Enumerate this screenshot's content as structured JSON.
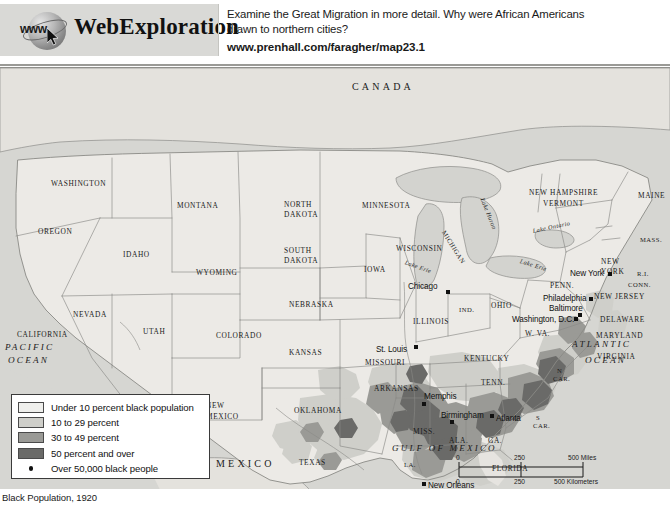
{
  "header": {
    "logo": {
      "globe_text": "www",
      "brand_web": "Web",
      "brand_exploration": "Exploration"
    },
    "prompt_line1": "Examine the Great Migration in more detail. Why were African Americans",
    "prompt_line2": "drawn to northern cities?",
    "url": "www.prenhall.com/faragher/map23.1"
  },
  "map": {
    "countries": [
      {
        "name": "CANADA",
        "x": 352,
        "y": 14
      },
      {
        "name": "MEXICO",
        "x": 216,
        "y": 391
      }
    ],
    "oceans": [
      {
        "name": "PACIFIC",
        "x": 5,
        "y": 275
      },
      {
        "name": "OCEAN",
        "x": 8,
        "y": 288
      },
      {
        "name": "ATLANTIC",
        "x": 572,
        "y": 272
      },
      {
        "name": "OCEAN",
        "x": 585,
        "y": 288
      }
    ],
    "gulf_label": {
      "name": "GULF OF MEXICO",
      "x": 392,
      "y": 376
    },
    "lakes": [
      {
        "name": "Lake Huron",
        "x": 482,
        "y": 127,
        "rot": 68
      },
      {
        "name": "Lake Erie",
        "x": 520,
        "y": 190,
        "rot": 17
      },
      {
        "name": "Lake Ontario",
        "x": 533,
        "y": 160,
        "rot": -12
      },
      {
        "name": "Lake Erie",
        "x": 405,
        "y": 191,
        "rot": 20
      }
    ],
    "states": [
      {
        "name": "WASHINGTON",
        "x": 51,
        "y": 112,
        "size": "state-sm"
      },
      {
        "name": "OREGON",
        "x": 38,
        "y": 160,
        "size": "state-sm"
      },
      {
        "name": "IDAHO",
        "x": 123,
        "y": 183,
        "size": "state-sm"
      },
      {
        "name": "MONTANA",
        "x": 177,
        "y": 134,
        "size": "state-sm"
      },
      {
        "name": "NORTH",
        "x": 284,
        "y": 133,
        "size": "state-sm"
      },
      {
        "name": "DAKOTA",
        "x": 284,
        "y": 143,
        "size": "state-sm"
      },
      {
        "name": "SOUTH",
        "x": 284,
        "y": 179,
        "size": "state-sm"
      },
      {
        "name": "DAKOTA",
        "x": 284,
        "y": 189,
        "size": "state-sm"
      },
      {
        "name": "MINNESOTA",
        "x": 362,
        "y": 134,
        "size": "state-sm"
      },
      {
        "name": "WYOMING",
        "x": 196,
        "y": 201,
        "size": "state-sm"
      },
      {
        "name": "NEBRASKA",
        "x": 289,
        "y": 233,
        "size": "state-sm"
      },
      {
        "name": "IOWA",
        "x": 364,
        "y": 198,
        "size": "state-sm"
      },
      {
        "name": "WISCONSIN",
        "x": 396,
        "y": 177,
        "size": "state-sm"
      },
      {
        "name": "NEVADA",
        "x": 73,
        "y": 243,
        "size": "state-sm"
      },
      {
        "name": "CALIFORNIA",
        "x": 17,
        "y": 263,
        "size": "state-sm"
      },
      {
        "name": "UTAH",
        "x": 143,
        "y": 260,
        "size": "state-sm"
      },
      {
        "name": "COLORADO",
        "x": 216,
        "y": 264,
        "size": "state-sm"
      },
      {
        "name": "KANSAS",
        "x": 289,
        "y": 281,
        "size": "state-sm"
      },
      {
        "name": "MISSOURI",
        "x": 365,
        "y": 291,
        "size": "state-sm"
      },
      {
        "name": "ILLINOIS",
        "x": 413,
        "y": 250,
        "size": "state-sm"
      },
      {
        "name": "IND.",
        "x": 459,
        "y": 239,
        "size": "state-xs"
      },
      {
        "name": "OHIO",
        "x": 491,
        "y": 234,
        "size": "state-sm"
      },
      {
        "name": "MICHIGAN",
        "x": 443,
        "y": 160,
        "size": "state-xs"
      },
      {
        "name": "ARIZONA",
        "x": 141,
        "y": 337,
        "size": "state-sm"
      },
      {
        "name": "NEW",
        "x": 206,
        "y": 334,
        "size": "state-sm"
      },
      {
        "name": "MEXICO",
        "x": 206,
        "y": 345,
        "size": "state-sm"
      },
      {
        "name": "OKLAHOMA",
        "x": 294,
        "y": 339,
        "size": "state-sm"
      },
      {
        "name": "TEXAS",
        "x": 299,
        "y": 391,
        "size": "state-sm"
      },
      {
        "name": "ARKANSAS",
        "x": 374,
        "y": 317,
        "size": "state-sm"
      },
      {
        "name": "KENTUCKY",
        "x": 464,
        "y": 287,
        "size": "state-sm"
      },
      {
        "name": "TENN.",
        "x": 481,
        "y": 311,
        "size": "state-sm"
      },
      {
        "name": "MISS.",
        "x": 413,
        "y": 360,
        "size": "state-sm"
      },
      {
        "name": "ALA.",
        "x": 449,
        "y": 369,
        "size": "state-sm"
      },
      {
        "name": "GA.",
        "x": 488,
        "y": 369,
        "size": "state-sm"
      },
      {
        "name": "LA.",
        "x": 404,
        "y": 394,
        "size": "state-xs"
      },
      {
        "name": "FLORIDA",
        "x": 492,
        "y": 397,
        "size": "state-sm"
      },
      {
        "name": "S",
        "x": 536,
        "y": 347,
        "size": "state-xs"
      },
      {
        "name": "CAR.",
        "x": 533,
        "y": 355,
        "size": "state-xs"
      },
      {
        "name": "N",
        "x": 557,
        "y": 300,
        "size": "state-xs"
      },
      {
        "name": "CAR.",
        "x": 553,
        "y": 308,
        "size": "state-xs"
      },
      {
        "name": "VIRGINIA",
        "x": 597,
        "y": 285,
        "size": "state-sm"
      },
      {
        "name": "W. VA.",
        "x": 525,
        "y": 262,
        "size": "state-sm"
      },
      {
        "name": "MARYLAND",
        "x": 596,
        "y": 264,
        "size": "state-sm"
      },
      {
        "name": "DELAWARE",
        "x": 600,
        "y": 248,
        "size": "state-sm"
      },
      {
        "name": "NEW JERSEY",
        "x": 594,
        "y": 225,
        "size": "state-sm"
      },
      {
        "name": "PENN.",
        "x": 550,
        "y": 214,
        "size": "state-sm"
      },
      {
        "name": "NEW",
        "x": 601,
        "y": 190,
        "size": "state-sm"
      },
      {
        "name": "YORK",
        "x": 601,
        "y": 200,
        "size": "state-sm"
      },
      {
        "name": "R.I.",
        "x": 637,
        "y": 203,
        "size": "state-xs"
      },
      {
        "name": "CONN.",
        "x": 628,
        "y": 214,
        "size": "state-xs"
      },
      {
        "name": "MASS.",
        "x": 640,
        "y": 169,
        "size": "state-xs"
      },
      {
        "name": "MAINE",
        "x": 638,
        "y": 124,
        "size": "state-sm"
      },
      {
        "name": "NEW HAMPSHIRE",
        "x": 529,
        "y": 121,
        "size": "state-sm"
      },
      {
        "name": "VERMONT",
        "x": 543,
        "y": 132,
        "size": "state-sm"
      }
    ],
    "cities": [
      {
        "name": "Chicago",
        "lx": 408,
        "ly": 215,
        "dx": 446,
        "dy": 222
      },
      {
        "name": "New York",
        "lx": 570,
        "ly": 202,
        "dx": 608,
        "dy": 204
      },
      {
        "name": "Philadelphia",
        "lx": 543,
        "ly": 227,
        "dx": 589,
        "dy": 229
      },
      {
        "name": "Baltimore",
        "lx": 549,
        "ly": 237,
        "dx": 578,
        "dy": 245
      },
      {
        "name": "Washington, D.C.",
        "lx": 512,
        "ly": 248,
        "dx": 574,
        "dy": 249
      },
      {
        "name": "St. Louis",
        "lx": 376,
        "ly": 278,
        "dx": 414,
        "dy": 277
      },
      {
        "name": "Memphis",
        "lx": 424,
        "ly": 325,
        "dx": 422,
        "dy": 334
      },
      {
        "name": "Birmingham",
        "lx": 441,
        "ly": 344,
        "dx": 450,
        "dy": 352
      },
      {
        "name": "Atlanta",
        "lx": 496,
        "ly": 347,
        "dx": 490,
        "dy": 346
      },
      {
        "name": "New Orleans",
        "lx": 428,
        "ly": 414,
        "dx": 422,
        "dy": 414
      }
    ],
    "legend": {
      "items": [
        {
          "label": "Under 10 percent black population",
          "color": "#efefec",
          "type": "swatch"
        },
        {
          "label": "10 to 29 percent",
          "color": "#cfcfca",
          "type": "swatch"
        },
        {
          "label": "30 to 49 percent",
          "color": "#9a9a96",
          "type": "swatch"
        },
        {
          "label": "50 percent and over",
          "color": "#6a6a68",
          "type": "swatch"
        },
        {
          "label": "Over 50,000 black people",
          "color": "#111111",
          "type": "dot"
        }
      ]
    },
    "scale": {
      "miles_zero": "0",
      "miles_mid": "250",
      "miles_end": "500 Miles",
      "km_zero": "0",
      "km_mid": "250",
      "km_end": "500 Kilometers"
    }
  },
  "caption": {
    "text": "Black Population, 1920"
  },
  "colors": {
    "map_bg": "#d8d8d4",
    "land_base": "#eceae6",
    "water": "#d6d6d2",
    "accent_dark": "#6a6a68"
  }
}
